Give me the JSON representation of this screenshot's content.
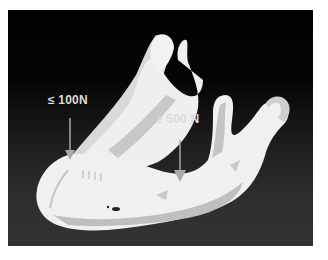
{
  "figure": {
    "background_color": "#0a0a0a",
    "bone_color": "#efefef",
    "shadow_color": "#b8b8b8",
    "arrow_color": "#a9a9a9"
  },
  "annotations": [
    {
      "id": "anterior",
      "text": "≤ 100N"
    },
    {
      "id": "posterior",
      "text": "≥ 500 N"
    }
  ]
}
